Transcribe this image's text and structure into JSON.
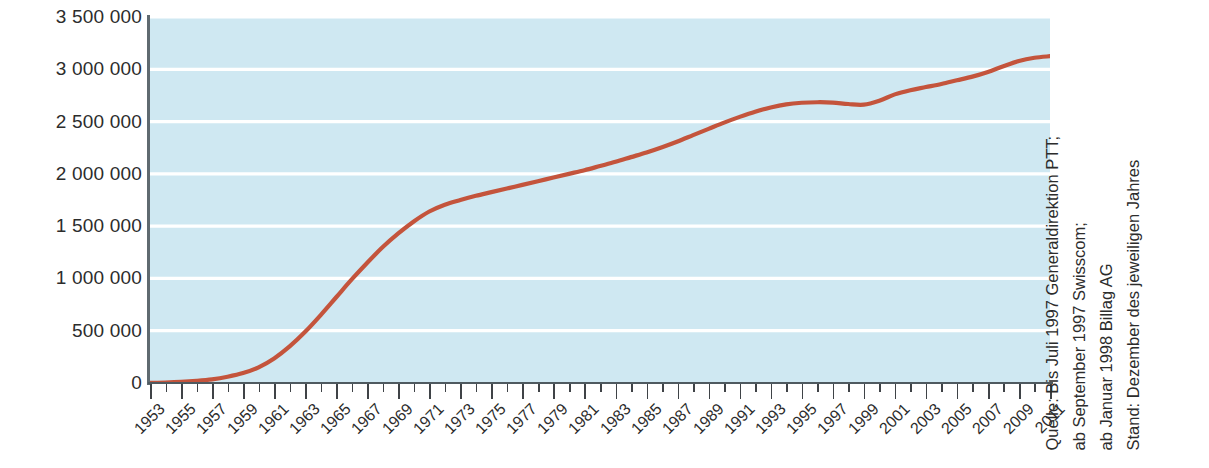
{
  "chart_data": {
    "type": "line",
    "title": "",
    "subtitle": "",
    "xlabel": "",
    "ylabel": "",
    "xlim": [
      1953,
      2011
    ],
    "ylim": [
      0,
      3500000
    ],
    "grid": true,
    "legend_position": "none",
    "line_color": "#c4543c",
    "plot_background": "#cfe8f2",
    "gridline_color": "#ffffff",
    "y_ticks": [
      0,
      500000,
      1000000,
      1500000,
      2000000,
      2500000,
      3000000,
      3500000
    ],
    "y_tick_labels": [
      "0",
      "500 000",
      "1 000 000",
      "1 500 000",
      "2 000 000",
      "2 500 000",
      "3 000 000",
      "3 500 000"
    ],
    "x_tick_labels": [
      "1953",
      "1955",
      "1957",
      "1959",
      "1961",
      "1963",
      "1965",
      "1967",
      "1969",
      "1971",
      "1973",
      "1975",
      "1977",
      "1979",
      "1981",
      "1983",
      "1985",
      "1987",
      "1989",
      "1991",
      "1993",
      "1995",
      "1997",
      "1999",
      "2001",
      "2003",
      "2005",
      "2007",
      "2009",
      "2011"
    ],
    "x_minor_years": [
      1954,
      1956,
      1958,
      1960,
      1962,
      1964,
      1966,
      1968,
      1970,
      1972,
      1974,
      1976,
      1978,
      1980,
      1982,
      1984,
      1986,
      1988,
      1990,
      1992,
      1994,
      1996,
      1998,
      2000,
      2002,
      2004,
      2006,
      2008,
      2010
    ],
    "series": [
      {
        "name": "Konzessionen",
        "x": [
          1953,
          1954,
          1955,
          1956,
          1957,
          1958,
          1959,
          1960,
          1961,
          1962,
          1963,
          1964,
          1965,
          1966,
          1967,
          1968,
          1969,
          1970,
          1971,
          1972,
          1973,
          1974,
          1975,
          1976,
          1977,
          1978,
          1979,
          1980,
          1981,
          1982,
          1983,
          1984,
          1985,
          1986,
          1987,
          1988,
          1989,
          1990,
          1991,
          1992,
          1993,
          1994,
          1995,
          1996,
          1997,
          1998,
          1999,
          2000,
          2001,
          2002,
          2003,
          2004,
          2005,
          2006,
          2007,
          2008,
          2009,
          2010,
          2011
        ],
        "values": [
          1000,
          4000,
          10000,
          20000,
          35000,
          60000,
          95000,
          150000,
          235000,
          350000,
          490000,
          650000,
          820000,
          990000,
          1150000,
          1300000,
          1430000,
          1545000,
          1640000,
          1705000,
          1750000,
          1790000,
          1825000,
          1860000,
          1895000,
          1930000,
          1965000,
          2000000,
          2035000,
          2075000,
          2115000,
          2160000,
          2205000,
          2255000,
          2310000,
          2370000,
          2430000,
          2490000,
          2545000,
          2595000,
          2635000,
          2665000,
          2680000,
          2685000,
          2682000,
          2668000,
          2662000,
          2700000,
          2760000,
          2800000,
          2830000,
          2860000,
          2895000,
          2930000,
          2975000,
          3030000,
          3080000,
          3110000,
          3125000
        ]
      }
    ]
  },
  "y_axis": {
    "labels": [
      {
        "value": 3500000,
        "text": "3 500 000"
      },
      {
        "value": 3000000,
        "text": "3 000 000"
      },
      {
        "value": 2500000,
        "text": "2 500 000"
      },
      {
        "value": 2000000,
        "text": "2 000 000"
      },
      {
        "value": 1500000,
        "text": "1 500 000"
      },
      {
        "value": 1000000,
        "text": "1 000 000"
      },
      {
        "value": 500000,
        "text": "500 000"
      },
      {
        "value": 0,
        "text": "0"
      }
    ]
  },
  "source_note": {
    "lines": [
      "Quelle: Bis Juli 1997 Generaldirektion PTT;",
      "ab September 1997 Swisscom;",
      "ab Januar 1998 Billag AG",
      "Stand: Dezember des jeweiligen Jahres"
    ]
  }
}
